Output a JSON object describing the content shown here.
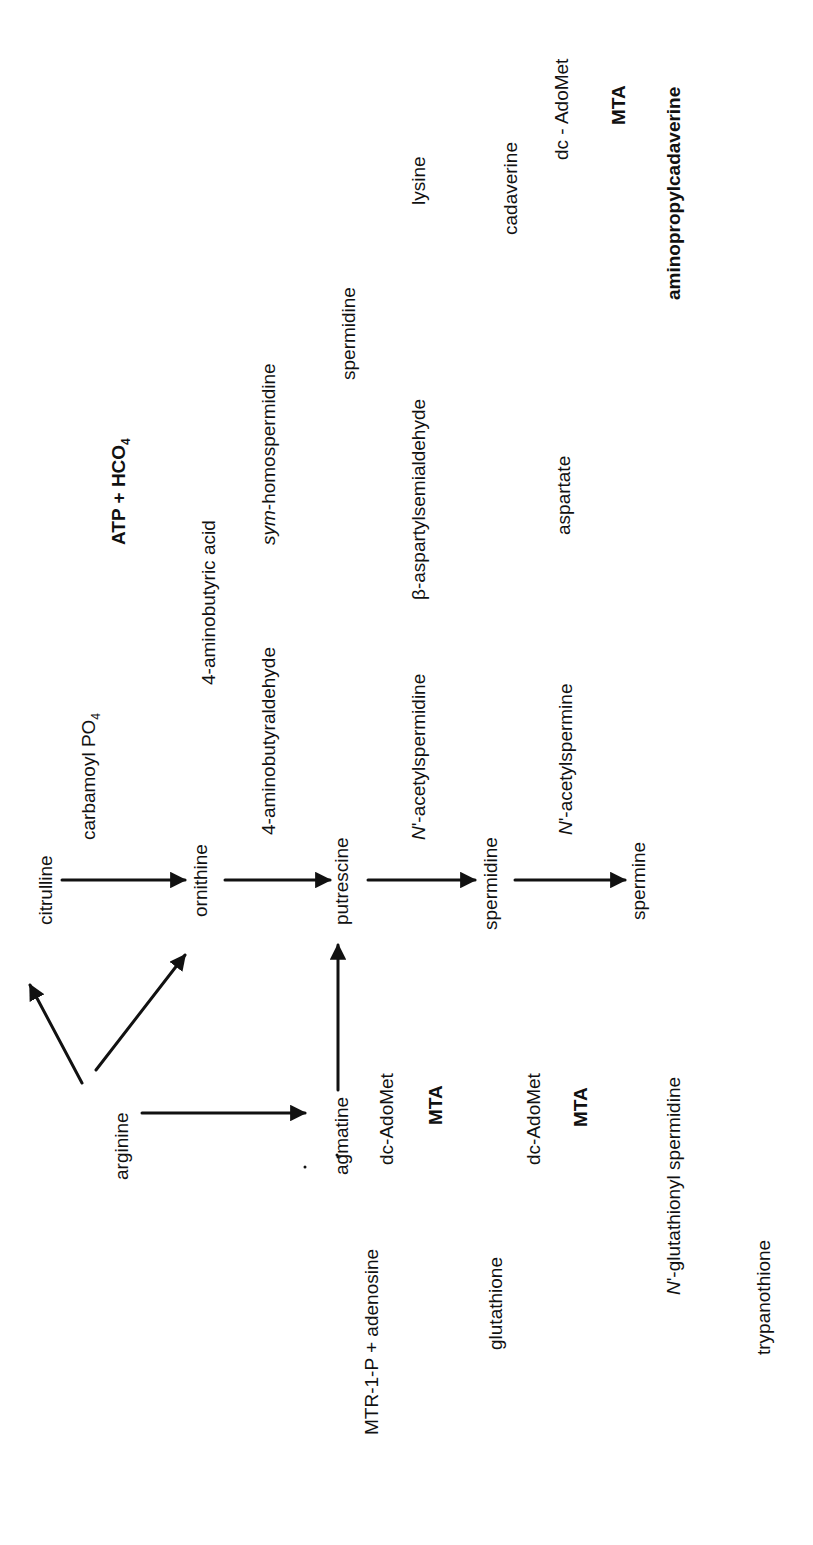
{
  "figure": {
    "type": "metabolic-pathway",
    "orientation": "rotated-90-ccw"
  },
  "compounds": {
    "arginine": "arginine",
    "citrulline": "citrulline",
    "ornithine": "ornithine",
    "agmatine": "agmatine",
    "putrescine": "putrescine",
    "spermidine": "spermidine",
    "spermine": "spermine",
    "carbamoyl_po4": "carbamoyl PO",
    "carbamoyl_sub": "4",
    "atp_hco3": "ATP  +  HCO",
    "atp_hco3_sub": "3",
    "aminobutyraldehyde": "4-aminobutyraldehyde",
    "aminobutyric_acid": "4-aminobutyric acid",
    "sym_prefix": "sym",
    "homospermidine": "-homospermidine",
    "spermidine_top": "spermidine",
    "acetylspermidine_prefix": "N",
    "acetylspermidine": "'-acetylspermidine",
    "acetylspermine_prefix": "N",
    "acetylspermine": "'-acetylspermine",
    "aspartylsemialdehyde": "β-aspartylsemialdehyde",
    "aspartate": "aspartate",
    "lysine": "lysine",
    "cadaverine": "cadaverine",
    "aminopropylcadaverine": "aminopropylcadaverine",
    "dc_adomet_1": "dc-AdoMet",
    "mta_1": "MTA",
    "dc_adomet_2": "dc-AdoMet",
    "mta_2": "MTA",
    "dc_adomet_3": "dc - AdoMet",
    "mta_3": "MTA",
    "mtr_adenosine": "MTR-1-P  +  adenosine",
    "glutathione": "glutathione",
    "glutathionyl_prefix": "N",
    "glutathionyl_spermidine": "'-glutathionyl spermidine",
    "trypanothione": "trypanothione"
  },
  "enzymes": {
    "e1": "1",
    "e2": "2",
    "e3": "3",
    "e4": "4",
    "e5": "5",
    "e6": "6",
    "e7": "7",
    "e8": "8",
    "e9": "9",
    "e10a": "10",
    "e10b": "10",
    "e11a": "11",
    "e11b": "11",
    "e11c": "11",
    "e12": "12",
    "e13": "13",
    "e14": "14",
    "e15": "15",
    "e16": "16",
    "e17": "17",
    "e18": "18",
    "e19": "19",
    "e20a": "20",
    "e20b": "20"
  },
  "reactions": [
    {
      "enzyme": "1",
      "from": "arginine",
      "to": "agmatine"
    },
    {
      "enzyme": "2",
      "from": "agmatine",
      "to": "putrescine"
    },
    {
      "enzyme": "3",
      "from": "arginine",
      "to": "ornithine"
    },
    {
      "enzyme": "4",
      "from": "arginine",
      "to": "citrulline"
    },
    {
      "enzyme": "5",
      "from": "carbamoyl PO4",
      "to": "ATP + HCO3"
    },
    {
      "enzyme": "6",
      "from": "citrulline",
      "to": "ornithine + carbamoyl PO4"
    },
    {
      "enzyme": "7",
      "from": "ornithine",
      "to": "putrescine"
    },
    {
      "enzyme": "8",
      "from": "putrescine + dc-AdoMet",
      "to": "spermidine + MTA"
    },
    {
      "enzyme": "9",
      "from": "spermidine + dc-AdoMet",
      "to": "spermine + MTA"
    },
    {
      "enzyme": "10",
      "from": "spermidine",
      "to": "N'-acetylspermidine"
    },
    {
      "enzyme": "10",
      "from": "spermine",
      "to": "N'-acetylspermine"
    },
    {
      "enzyme": "11",
      "from": "putrescine",
      "to": "4-aminobutyraldehyde"
    },
    {
      "enzyme": "11",
      "from": "N'-acetylspermidine",
      "to": "putrescine"
    },
    {
      "enzyme": "11",
      "from": "N'-acetylspermine",
      "to": "spermidine"
    },
    {
      "enzyme": "12",
      "from": "4-aminobutyraldehyde",
      "to": "4-aminobutyric acid"
    },
    {
      "enzyme": "13",
      "from": "4-aminobutyraldehyde + putrescine",
      "to": "sym-homospermidine"
    },
    {
      "enzyme": "14",
      "from": "aspartate",
      "to": "β-aspartylsemialdehyde"
    },
    {
      "enzyme": "15",
      "from": "β-aspartylsemialdehyde",
      "to": "β-aspartylsemialdehyde"
    },
    {
      "enzyme": "16",
      "from": "putrescine + β-aspartylsemialdehyde",
      "to": "spermidine"
    },
    {
      "enzyme": "17",
      "from": "lysine",
      "to": "cadaverine"
    },
    {
      "enzyme": "18",
      "from": "cadaverine + dc-AdoMet",
      "to": "aminopropylcadaverine + MTA"
    },
    {
      "enzyme": "19",
      "from": "MTA",
      "to": "MTR-1-P + adenosine"
    },
    {
      "enzyme": "20",
      "from": "spermidine + glutathione",
      "to": "N'-glutathionyl spermidine"
    },
    {
      "enzyme": "20",
      "from": "N'-glutathionyl spermidine + glutathione",
      "to": "trypanothione"
    }
  ]
}
